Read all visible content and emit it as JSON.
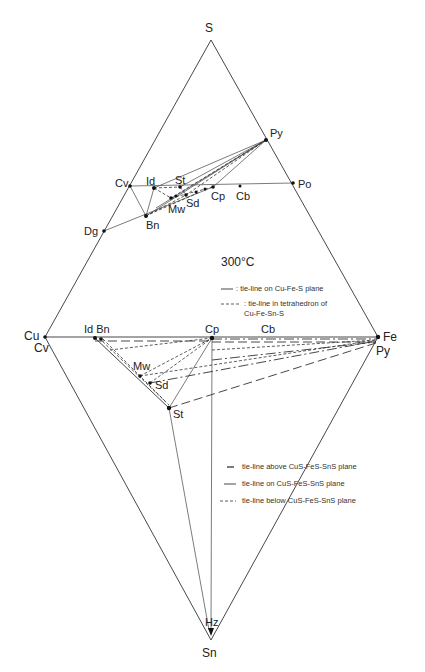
{
  "vertices": {
    "s": "S",
    "cu": "Cu",
    "cu_sub": "Cv",
    "fe": "Fe",
    "fe_sub": "Py",
    "sn": "Sn",
    "hz": "Hz"
  },
  "upper_phases": {
    "py": "Py",
    "cv": "Cv",
    "id": "Id",
    "st": "St",
    "po": "Po",
    "cp": "Cp",
    "cb": "Cb",
    "sd": "Sd",
    "mw": "Mw",
    "bn": "Bn",
    "dg": "Dg"
  },
  "lower_phases": {
    "id_bn": "Id Bn",
    "cp": "Cp",
    "cb": "Cb",
    "mw": "Mw",
    "sd": "Sd",
    "st": "St"
  },
  "temperature": "300°C",
  "legend_upper": [
    {
      "style": "solid",
      "text": ": tie-line on Cu-Fe-S plane"
    },
    {
      "style": "dashed",
      "text": ": tie-line in tetrahedron of"
    },
    {
      "style": "none",
      "text": "Cu-Fe-Sn-S"
    }
  ],
  "legend_lower": [
    {
      "style": "dash-dot",
      "text": "tie-line above CuS-FeS-SnS plane"
    },
    {
      "style": "long-dash",
      "text": "tie-line on CuS-FeS-SnS plane"
    },
    {
      "style": "short-dash",
      "text": "tie-line below CuS-FeS-SnS plane"
    }
  ]
}
